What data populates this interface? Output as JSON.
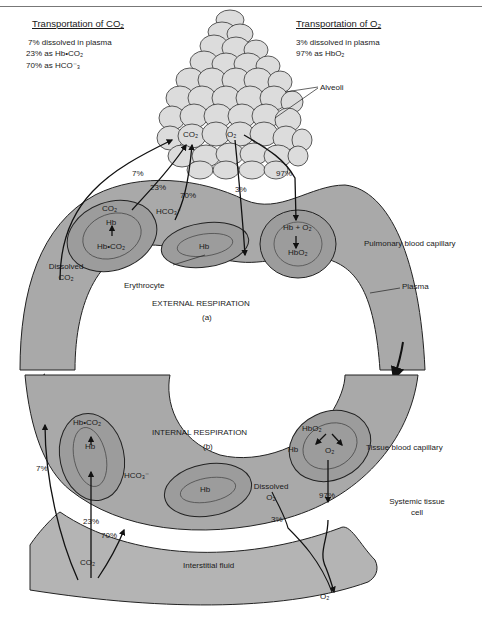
{
  "co2_transport": {
    "title": "Transportation of CO₂",
    "lines": [
      "7% dissolved in plasma",
      "23% as Hb•CO₂",
      "70% as HCO⁻₃"
    ]
  },
  "o2_transport": {
    "title": "Transportation of O₂",
    "lines": [
      "3% dissolved in plasma",
      "97% as HbO₂"
    ]
  },
  "external": {
    "alveoli_label": "Alveoli",
    "co2": "CO₂",
    "o2": "O₂",
    "pct_7": "7%",
    "pct_23": "23%",
    "pct_70": "70%",
    "pct_3": "3%",
    "pct_97": "97%",
    "hco3": "HCO₃⁻",
    "rbc_left_top": "CO₂",
    "rbc_left_mid": "Hb",
    "rbc_left_bottom": "Hb•CO₂",
    "rbc_center": "Hb",
    "rbc_right_top": "Hb + O₂",
    "rbc_right_bottom": "HbO₂",
    "dissolved_co2": [
      "Dissolved",
      "CO₂"
    ],
    "erythrocyte": "Erythrocyte",
    "title": "EXTERNAL RESPIRATION",
    "sub": "(a)",
    "pulmonary_capillary": "Pulmonary blood capillary",
    "plasma": "Plasma"
  },
  "internal": {
    "title": "INTERNAL RESPIRATION",
    "sub": "(b)",
    "rbc_left_top": "Hb•CO₂",
    "rbc_left_mid": "Hb",
    "rbc_center": "Hb",
    "rbc_right_top": "HbO₂",
    "rbc_right_left": "Hb",
    "rbc_right_right": "O₂",
    "hco3": "HCO₃⁻",
    "pct_7": "7%",
    "pct_23": "23%",
    "pct_70": "70%",
    "co2": "CO₂",
    "dissolved_o2": [
      "Dissolved",
      "O₂"
    ],
    "pct_3": "3%",
    "pct_97": "97%",
    "o2": "O₂",
    "tissue_capillary": "Tissue blood capillary",
    "systemic_cell": [
      "Systemic tissue",
      "cell"
    ],
    "interstitial": "Interstitial fluid"
  },
  "colors": {
    "capillary": "#a9a9a9",
    "rbc_outer": "#9c9c9c",
    "rbc_inner": "#8f8f8f",
    "alveoli": "#dcdcdc",
    "tissue": "#b4b4b4",
    "stroke": "#222222"
  }
}
